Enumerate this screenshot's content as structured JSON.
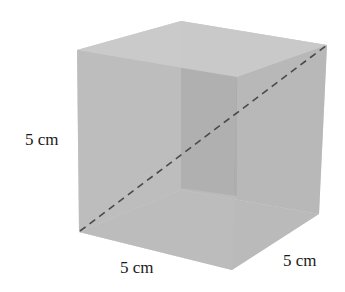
{
  "diagram": {
    "type": "cube",
    "labels": {
      "height": "5 cm",
      "width": "5 cm",
      "depth": "5 cm"
    },
    "colors": {
      "face_light": "#bdbdbd",
      "face_mid": "#b3b3b3",
      "face_top": "#c6c6c6",
      "inner_back": "#a3a3a3",
      "diagonal": "#4a4a4a",
      "text": "#1a1a1a"
    },
    "vertices": {
      "top_left": [
        77,
        50
      ],
      "top_back": [
        181,
        21
      ],
      "top_right": [
        327,
        45
      ],
      "top_front": [
        237,
        77
      ],
      "bottom_left": [
        79,
        232
      ],
      "bottom_back": [
        181,
        190
      ],
      "bottom_right": [
        319,
        214
      ],
      "bottom_front": [
        232,
        270
      ]
    },
    "diagonal": {
      "from": "bottom_left",
      "to": "top_right",
      "style": "dashed"
    }
  }
}
